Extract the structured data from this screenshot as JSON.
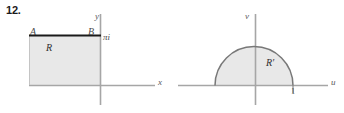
{
  "figure": {
    "problem_number": "12.",
    "left_panel": {
      "region_label": "R",
      "corner_label_left": "A",
      "corner_label_right": "B",
      "axis_label_horizontal": "x",
      "axis_label_vertical": "y",
      "point_label": "πi",
      "region_fill": "#e8e8e8",
      "region_stroke": "#1a1a1a",
      "axis_color": "#9a9a9a"
    },
    "right_panel": {
      "region_label": "R′",
      "axis_label_horizontal": "u",
      "axis_label_vertical": "v",
      "tick_label": "1",
      "region_fill": "#e8e8e8",
      "region_stroke": "#7a7a7a",
      "axis_color": "#9a9a9a"
    }
  }
}
